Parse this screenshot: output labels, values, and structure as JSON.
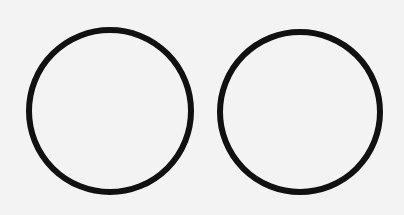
{
  "diagram": {
    "background": "#f3f3f3",
    "stroke_color": "#111111",
    "circles": [
      {
        "name": "left-circle",
        "cx": 110,
        "cy": 111,
        "r": 81,
        "stroke_width": 6
      },
      {
        "name": "right-circle",
        "cx": 300,
        "cy": 112,
        "r": 80,
        "stroke_width": 6
      }
    ]
  }
}
